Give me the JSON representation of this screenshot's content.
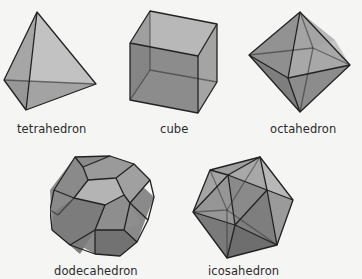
{
  "figure": {
    "solids": [
      {
        "name": "tetrahedron",
        "label": "tetrahedron"
      },
      {
        "name": "cube",
        "label": "cube"
      },
      {
        "name": "octahedron",
        "label": "octahedron"
      },
      {
        "name": "dodecahedron",
        "label": "dodecahedron"
      },
      {
        "name": "icosahedron",
        "label": "icosahedron"
      }
    ]
  },
  "colors": {
    "background": "#f5f5f4",
    "edge": "#222222",
    "face_light": "#c8c8c8",
    "face_mid": "#9a9a9a",
    "face_dark": "#6e6e6e"
  }
}
